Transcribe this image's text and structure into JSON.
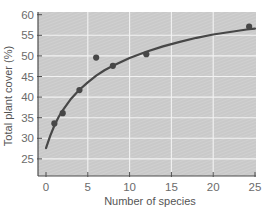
{
  "chart_data": {
    "type": "scatter",
    "title": "",
    "xlabel": "Number of species",
    "ylabel": "Total plant cover (%)",
    "xlim": [
      -1,
      25
    ],
    "ylim": [
      21,
      60
    ],
    "xticks": [
      0,
      5,
      10,
      15,
      20,
      25
    ],
    "yticks": [
      25,
      30,
      35,
      40,
      45,
      50,
      55,
      60
    ],
    "grid": true,
    "legend": null,
    "series": [
      {
        "name": "Observed plots",
        "kind": "scatter",
        "x": [
          1,
          2,
          4,
          6,
          8,
          12,
          24.3
        ],
        "y": [
          33.6,
          36.1,
          41.7,
          49.6,
          47.6,
          50.4,
          57.1
        ]
      },
      {
        "name": "Fitted curve",
        "kind": "line",
        "x": [
          0,
          0.5,
          1,
          1.5,
          2,
          3,
          4,
          5,
          6,
          7,
          8,
          10,
          12,
          14,
          16,
          18,
          20,
          22,
          24,
          25
        ],
        "y": [
          27.6,
          30.6,
          33.1,
          35.1,
          36.8,
          39.6,
          41.8,
          43.6,
          45.2,
          46.5,
          47.6,
          49.5,
          51.0,
          52.3,
          53.4,
          54.4,
          55.2,
          55.8,
          56.4,
          56.6
        ]
      }
    ]
  },
  "colors": {
    "plot_background": "#c9c9c9",
    "hatch": "#d6d6d6",
    "gridline": "#f2f2f2",
    "data": "#474747",
    "axis": "#4d4d4d",
    "tick_label": "#6b6b6b"
  }
}
